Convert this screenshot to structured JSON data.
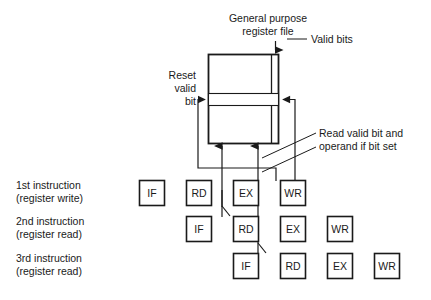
{
  "figure": {
    "title_top": {
      "line1": "General purpose",
      "line2": "register file"
    },
    "annotations": {
      "valid_bits": "Valid bits",
      "reset_valid_bit": {
        "line1": "Reset",
        "line2": "valid",
        "line3": "bit"
      },
      "read_valid_bit": {
        "line1": "Read valid bit and",
        "line2": "operand if bit set"
      }
    },
    "row_labels": [
      {
        "line1": "1st instruction",
        "line2": "(register write)"
      },
      {
        "line1": "2nd instruction",
        "line2": "(register read)"
      },
      {
        "line1": "3rd instruction",
        "line2": "(register read)"
      }
    ],
    "pipeline_stages": {
      "row1": [
        "IF",
        "RD",
        "EX",
        "WR"
      ],
      "row2": [
        "IF",
        "RD",
        "EX",
        "WR"
      ],
      "row3": [
        "IF",
        "RD",
        "EX",
        "WR"
      ]
    },
    "colors": {
      "ink": "#1a1a1a",
      "background": "#ffffff"
    }
  }
}
